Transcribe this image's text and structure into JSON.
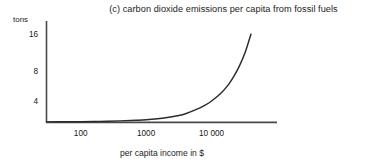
{
  "chart_data": {
    "type": "line",
    "title": "(c) carbon dioxide emissions per capita from fossil fuels",
    "xlabel": "per capita income in $",
    "ylabel": "tons",
    "xscale": "log",
    "x_tick_labels": [
      "100",
      "1000",
      "10 000"
    ],
    "x_tick_values": [
      100,
      1000,
      10000
    ],
    "y_tick_labels": [
      "16",
      "8",
      "4"
    ],
    "y_tick_values": [
      16,
      8,
      4
    ],
    "xlim": [
      30,
      100000
    ],
    "ylim": [
      0,
      20
    ],
    "grid": false,
    "legend": false,
    "series": [
      {
        "name": "carbon dioxide emissions per capita",
        "x": [
          30,
          60,
          100,
          200,
          400,
          700,
          1000,
          1500,
          2000,
          3000,
          4000,
          6000,
          8000,
          10000,
          14000,
          18000,
          22000,
          27000,
          33000,
          40000
        ],
        "y": [
          0.08,
          0.1,
          0.12,
          0.18,
          0.28,
          0.4,
          0.5,
          0.7,
          0.9,
          1.3,
          1.7,
          2.6,
          3.4,
          4.2,
          5.8,
          7.4,
          9.1,
          11.3,
          14.0,
          17.4
        ]
      }
    ],
    "colors": {
      "line": "#2b2b2b",
      "axis": "#4a4a4a",
      "background": "#ffffff",
      "text": "#1c1c1c"
    }
  }
}
